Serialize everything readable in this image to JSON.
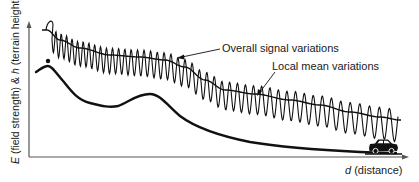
{
  "figure": {
    "y_axis_label": {
      "var": "E",
      "text": " (field strength) & ",
      "var2": "h",
      "text2": " (terrain height)"
    },
    "x_axis_label": {
      "var": "d",
      "text": " (distance)"
    },
    "annotations": {
      "overall": "Overall signal variations",
      "local": "Local mean variations"
    },
    "icons": {
      "vehicle": "car-icon",
      "transmitter": "transmitter-dot-icon"
    },
    "colors": {
      "ink": "#1a1a1a",
      "axis": "#555555",
      "background": "#ffffff"
    }
  },
  "chart_data": {
    "type": "line",
    "title": "",
    "xlabel": "d (distance)",
    "ylabel": "E (field strength) & h (terrain height)",
    "grid": false,
    "legend": "none (inline annotations)",
    "series": [
      {
        "name": "Overall signal variations (fast fading)",
        "description": "rapid oscillation around local mean, decreasing with distance"
      },
      {
        "name": "Local mean variations",
        "description": "smooth declining curve with a bump mid-distance"
      },
      {
        "name": "Terrain height",
        "description": "peak near transmitter, dip, hill at mid-distance, then low flat terrain toward vehicle"
      }
    ]
  }
}
